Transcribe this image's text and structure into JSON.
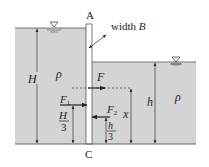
{
  "diagram": {
    "labels": {
      "top_point": "A",
      "bottom_point": "C",
      "width": "width ",
      "width_var": "B",
      "left_depth": "H",
      "right_depth": "h",
      "left_density": "ρ",
      "right_density": "ρ",
      "resultant_force": "F",
      "left_force": "F",
      "left_force_sub": "1",
      "right_force": "F",
      "right_force_sub": "2",
      "left_lever_num": "H",
      "left_lever_den": "3",
      "right_lever_num": "h",
      "right_lever_den": "3",
      "resultant_height": "x"
    },
    "colors": {
      "water": "#d4d4d4",
      "line": "#333333",
      "gate": "#ffffff",
      "background": "#ffffff"
    }
  }
}
